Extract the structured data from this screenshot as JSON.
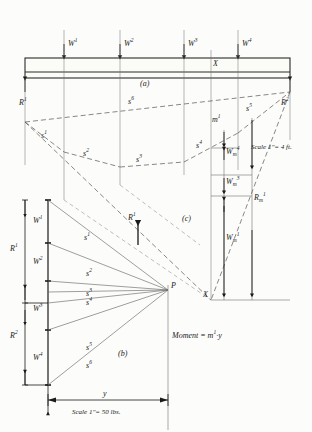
{
  "figure": {
    "title_parts": [
      "(a)",
      "(b)",
      "(c)"
    ],
    "type": "graphical-statics-funicular-polygon"
  },
  "panel_a": {
    "caption": "(a)",
    "loads": [
      {
        "name": "W1",
        "label_html": "W<sup>1</sup>",
        "x": 64
      },
      {
        "name": "W2",
        "label_html": "W<sup>2</sup>",
        "x": 120
      },
      {
        "name": "W3",
        "label_html": "W<sup>3</sup>",
        "x": 184
      },
      {
        "name": "W4",
        "label_html": "W<sup>4</sup>",
        "x": 238
      }
    ],
    "section_marker": "X",
    "reactions": [
      {
        "name": "R1",
        "label_html": "R<sup>1</sup>"
      },
      {
        "name": "R2",
        "label_html": "R<sup>2</sup>"
      }
    ]
  },
  "panel_b": {
    "caption": "(b)",
    "pole_label": "P",
    "load_line_segments": [
      {
        "name": "W1",
        "label_html": "W<sup>1</sup>"
      },
      {
        "name": "W2",
        "label_html": "W<sup>2</sup>"
      },
      {
        "name": "W3",
        "label_html": "W<sup>3</sup>"
      },
      {
        "name": "W4",
        "label_html": "W<sup>4</sup>"
      },
      {
        "name": "R1",
        "label_html": "R<sup>1</sup>"
      },
      {
        "name": "R2",
        "label_html": "R<sup>2</sup>"
      }
    ],
    "rays": [
      {
        "label_html": "s<sup>1</sup>"
      },
      {
        "label_html": "s<sup>2</sup>"
      },
      {
        "label_html": "s<sup>3</sup>"
      },
      {
        "label_html": "s<sup>4</sup>"
      },
      {
        "label_html": "s<sup>5</sup>"
      },
      {
        "label_html": "s<sup>6</sup>"
      }
    ],
    "distance_label": "y",
    "scale": "Scale  1\"= 50 lbs."
  },
  "panel_c": {
    "caption": "(c)",
    "ordinate_label_html": "m<sup>1</sup>",
    "section_marker": "X",
    "measured": [
      {
        "name": "W4m",
        "label_html": "W<sub>m</sub><sup>4</sup>"
      },
      {
        "name": "W3m",
        "label_html": "W<sub>m</sub><sup>3</sup>"
      },
      {
        "name": "R1m",
        "label_html": "R<sub>m</sub><sup>1</sup>"
      },
      {
        "name": "W1m",
        "label_html": "W<sub>m</sub><sup>1</sup>"
      }
    ],
    "scale": "Scale  1\"= 4 ft."
  },
  "equation": {
    "moment_text_html": "Moment = m<sup>1</sup>·y"
  },
  "funicular_labels": [
    {
      "label_html": "s<sup>1</sup>"
    },
    {
      "label_html": "s<sup>2</sup>"
    },
    {
      "label_html": "s<sup>3</sup>"
    },
    {
      "label_html": "s<sup>4</sup>"
    },
    {
      "label_html": "s<sup>5</sup>"
    },
    {
      "label_html": "s<sup>6</sup>"
    }
  ],
  "mid_reaction_label_html": "R<sup>1</sup>",
  "colors": {
    "ink": "#1a1a1a",
    "thin": "#555555",
    "dashed": "#666666",
    "paper": "#fcfcfa"
  }
}
